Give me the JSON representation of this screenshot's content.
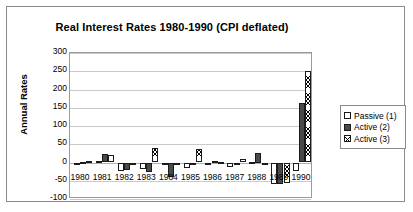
{
  "chart_data": {
    "type": "bar",
    "title": "Real Interest Rates 1980-1990 (CPI deflated)",
    "xlabel": "",
    "ylabel": "Annual Rates",
    "ylim": [
      -100,
      300
    ],
    "ytick_step": 50,
    "grid": true,
    "legend_position": "right",
    "categories": [
      "1980",
      "1981",
      "1982",
      "1983",
      "1984",
      "1985",
      "1986",
      "1987",
      "1988",
      "1989",
      "1990"
    ],
    "yticks": [
      "300",
      "250",
      "200",
      "150",
      "100",
      "50",
      "0",
      "-50",
      "-100"
    ],
    "series": [
      {
        "name": "Passive (1)",
        "pattern": "empty",
        "color": "#ffffff",
        "values": [
          -3,
          3,
          -22,
          -18,
          -4,
          -14,
          -8,
          -12,
          2,
          -58,
          -22
        ]
      },
      {
        "name": "Active (2)",
        "pattern": "solid",
        "color": "#4a4a4a",
        "values": [
          2,
          22,
          -20,
          -27,
          -40,
          -2,
          5,
          -2,
          25,
          -60,
          162
        ]
      },
      {
        "name": "Active (3)",
        "pattern": "crosshatch",
        "color": "#ffffff",
        "values": [
          3,
          21,
          -3,
          40,
          -3,
          38,
          2,
          9,
          -2,
          -57,
          252
        ]
      }
    ]
  },
  "legend": {
    "items": [
      {
        "label": "Passive (1)"
      },
      {
        "label": "Active (2)"
      },
      {
        "label": "Active (3)"
      }
    ]
  }
}
